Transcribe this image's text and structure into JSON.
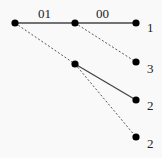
{
  "diagram": {
    "type": "tree",
    "background": "#f9f9f9",
    "nodes": [
      {
        "id": "root",
        "x": 15,
        "y": 23
      },
      {
        "id": "mid_top",
        "x": 75,
        "y": 23
      },
      {
        "id": "mid_low",
        "x": 75,
        "y": 64
      },
      {
        "id": "leaf_1",
        "x": 136,
        "y": 23,
        "label": "1"
      },
      {
        "id": "leaf_3",
        "x": 136,
        "y": 62,
        "label": "3"
      },
      {
        "id": "leaf_2a",
        "x": 136,
        "y": 100,
        "label": "2"
      },
      {
        "id": "leaf_2b",
        "x": 136,
        "y": 137,
        "label": "2"
      }
    ],
    "edges": [
      {
        "from": "root",
        "to": "mid_top",
        "style": "solid",
        "label": "01"
      },
      {
        "from": "mid_top",
        "to": "leaf_1",
        "style": "solid",
        "label": "00"
      },
      {
        "from": "mid_top",
        "to": "leaf_3",
        "style": "dashed"
      },
      {
        "from": "root",
        "to": "mid_low",
        "style": "dashed"
      },
      {
        "from": "mid_low",
        "to": "leaf_2a",
        "style": "solid"
      },
      {
        "from": "mid_low",
        "to": "leaf_2b",
        "style": "dashed"
      }
    ],
    "edge_labels": {
      "root_mid_top": "01",
      "mid_top_leaf_1": "00"
    },
    "leaf_labels": {
      "leaf_1": "1",
      "leaf_3": "3",
      "leaf_2a": "2",
      "leaf_2b": "2"
    }
  }
}
